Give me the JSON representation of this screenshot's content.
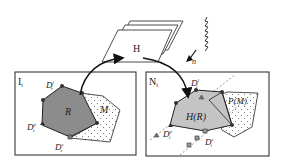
{
  "diagram": {
    "panels": {
      "left": {
        "label": "I",
        "label_sub": "t"
      },
      "right": {
        "label": "N",
        "label_sub": "i"
      }
    },
    "homography": {
      "label": "H"
    },
    "light": {
      "label": "n"
    },
    "left_region": {
      "label": "R",
      "mask_label": "M"
    },
    "right_region": {
      "label": "H(R)",
      "mask_label": "P(M)",
      "mask_label_sub": "i"
    },
    "points": {
      "left_top": {
        "base": "D",
        "sup": "l",
        "sub": "t"
      },
      "left_left": {
        "base": "D",
        "sup": "p",
        "sub": "t"
      },
      "left_bottom": {
        "base": "D",
        "sup": "s",
        "sub": "t"
      },
      "right_top": {
        "base": "D",
        "sup": "l",
        "sub": "i"
      },
      "right_left": {
        "base": "D",
        "sup": "p",
        "sub": "i"
      },
      "right_bottom": {
        "base": "D",
        "sup": "s",
        "sub": "i"
      }
    },
    "colors": {
      "region_left": "#8c8c8c",
      "region_right": "#c4c4c4",
      "outline": "#222222",
      "background": "#ffffff"
    }
  }
}
